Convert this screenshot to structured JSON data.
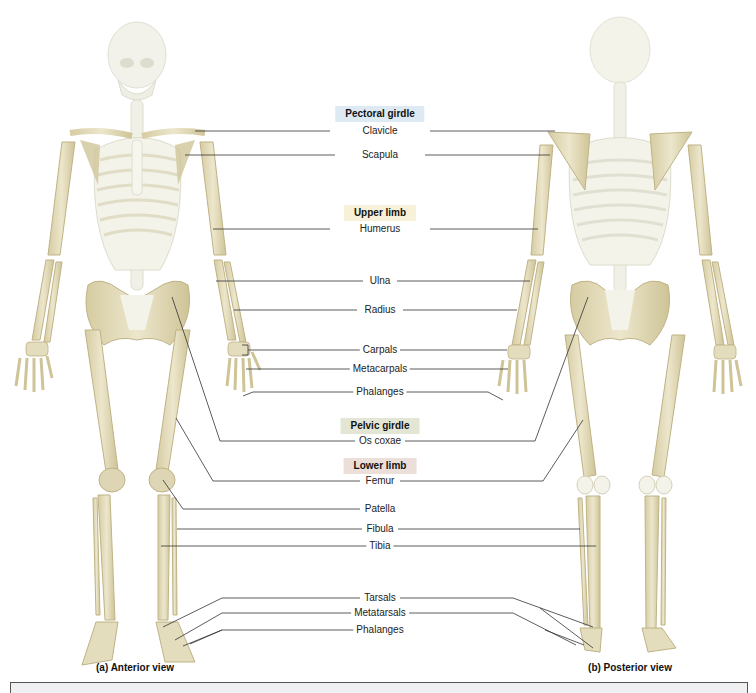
{
  "figure": {
    "colors": {
      "bone": "#e6dfc2",
      "bone_shadow": "#c9bd8f",
      "axial_bone": "#f3f3ea",
      "leader_line": "#333333",
      "pectoral_bg": "#dde9f3",
      "upper_limb_bg": "#f6f1d8",
      "pelvic_bg": "#e3e6d5",
      "lower_limb_bg": "#ecdfd9"
    },
    "groups": [
      {
        "id": "pectoral",
        "header": "Pectoral girdle",
        "bg": "#dde9f3",
        "y": 114,
        "labels": [
          {
            "text": "Clavicle",
            "y": 131
          },
          {
            "text": "Scapula",
            "y": 155
          }
        ]
      },
      {
        "id": "upper-limb",
        "header": "Upper limb",
        "bg": "#f6f1d8",
        "y": 213,
        "labels": [
          {
            "text": "Humerus",
            "y": 229
          },
          {
            "text": "Ulna",
            "y": 281
          },
          {
            "text": "Radius",
            "y": 310
          },
          {
            "text": "Carpals",
            "y": 350
          },
          {
            "text": "Metacarpals",
            "y": 369
          },
          {
            "text": "Phalanges",
            "y": 392
          }
        ]
      },
      {
        "id": "pelvic",
        "header": "Pelvic girdle",
        "bg": "#e3e6d5",
        "y": 426,
        "labels": [
          {
            "text": "Os coxae",
            "y": 441
          }
        ]
      },
      {
        "id": "lower-limb",
        "header": "Lower limb",
        "bg": "#ecdfd9",
        "y": 466,
        "labels": [
          {
            "text": "Femur",
            "y": 481
          },
          {
            "text": "Patella",
            "y": 509
          },
          {
            "text": "Fibula",
            "y": 529
          },
          {
            "text": "Tibia",
            "y": 546
          },
          {
            "text": "Tarsals",
            "y": 598
          },
          {
            "text": "Metatarsals",
            "y": 613
          },
          {
            "text": "Phalanges",
            "y": 630
          }
        ]
      }
    ],
    "captions": {
      "anterior": "(a) Anterior view",
      "posterior": "(b) Posterior view"
    }
  }
}
